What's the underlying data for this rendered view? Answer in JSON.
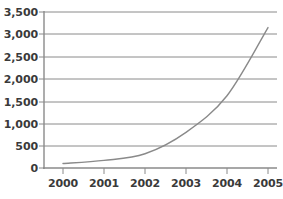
{
  "chart_data": {
    "type": "line",
    "title": "",
    "subtitle": "",
    "xlabel": "",
    "ylabel": "",
    "categories": [
      "2000",
      "2001",
      "2002",
      "2003",
      "2004",
      "2005"
    ],
    "x": [
      2000,
      2001,
      2002,
      2003,
      2004,
      2005
    ],
    "values": [
      100,
      170,
      320,
      800,
      1620,
      3150
    ],
    "series": [
      {
        "name": "",
        "values": [
          100,
          170,
          320,
          800,
          1620,
          3150
        ],
        "color": "#8a8a8a"
      }
    ],
    "ylim": [
      0,
      3500
    ],
    "ytick_values": [
      0,
      500,
      1000,
      1500,
      2000,
      2500,
      3000,
      3500
    ],
    "ytick_labels": [
      "0",
      "500",
      "1,000",
      "1,500",
      "2,000",
      "2,500",
      "3,000",
      "3,500"
    ],
    "xtick_labels": [
      "2000",
      "2001",
      "2002",
      "2003",
      "2004",
      "2005"
    ],
    "grid": true,
    "grid_orientation": "horizontal",
    "legend": false,
    "legend_position": "none",
    "annotations": [],
    "colors": {
      "line": "#8a8a8a",
      "grid": "#8a8a8a",
      "axis": "#8a8a8a",
      "text": "#3a3a3a",
      "background": "#ffffff"
    }
  }
}
